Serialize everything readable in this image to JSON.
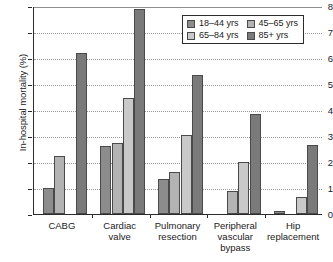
{
  "chart_data": {
    "type": "bar",
    "title": "",
    "subtitle": "",
    "xlabel": "",
    "ylabel": "In-hospital mortality (%)",
    "ylim": [
      0,
      8
    ],
    "ytick_values": [
      0,
      1,
      2,
      3,
      4,
      5,
      6,
      7,
      8
    ],
    "ytick_labels": [
      "0",
      "1",
      "2",
      "3",
      "4",
      "5",
      "6",
      "7",
      "8"
    ],
    "grid": "horizontal-dotted",
    "legend_position": "top-right",
    "legend_columns": 2,
    "categories": [
      "CABG",
      "Cardiac valve",
      "Pulmonary resection",
      "Peripheral vascular bypass",
      "Hip replacement"
    ],
    "category_label_lines": [
      [
        "CABG"
      ],
      [
        "Cardiac",
        "valve"
      ],
      [
        "Pulmonary",
        "resection"
      ],
      [
        "Peripheral",
        "vascular",
        "bypass"
      ],
      [
        "Hip",
        "replacement"
      ]
    ],
    "series": [
      {
        "name": "18–44 yrs",
        "color": "#8c8c8c",
        "values": [
          1.0,
          2.6,
          1.35,
          0.0,
          0.1
        ]
      },
      {
        "name": "45–65 yrs",
        "color": "#b3b3b3",
        "values": [
          2.25,
          2.75,
          1.6,
          0.9,
          0.0
        ]
      },
      {
        "name": "65–84 yrs",
        "color": "#c9c9c9",
        "values": [
          0.0,
          4.45,
          3.05,
          2.0,
          0.65
        ]
      },
      {
        "name": "85+ yrs",
        "color": "#7a7a7a",
        "values": [
          6.2,
          7.9,
          5.35,
          3.85,
          2.65
        ]
      }
    ]
  },
  "legend": {
    "entries": [
      {
        "label": "18–44 yrs",
        "color": "#8c8c8c"
      },
      {
        "label": "45–65 yrs",
        "color": "#b3b3b3"
      },
      {
        "label": "65–84 yrs",
        "color": "#c9c9c9"
      },
      {
        "label": "85+ yrs",
        "color": "#7a7a7a"
      }
    ]
  },
  "axis": {
    "y_title": "In-hospital mortality (%)"
  }
}
